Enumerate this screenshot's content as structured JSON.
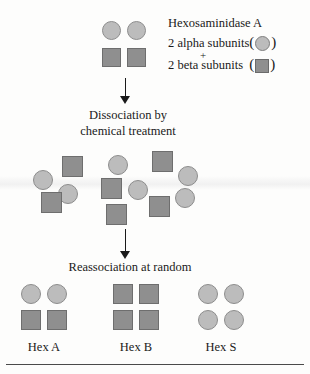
{
  "figure": {
    "title_text": "Hexosaminidase A subunit dissociation and reassociation",
    "legend": {
      "heading": "Hexosaminidase A",
      "alpha_line": "2 alpha subunits",
      "plus": "+",
      "beta_line": "2 beta subunits",
      "open_paren": "(",
      "close_paren": ")",
      "alpha_swatch": "circle-subunit-icon",
      "beta_swatch": "square-subunit-icon"
    },
    "steps": [
      {
        "line1": "Dissociation by",
        "line2": "chemical treatment"
      },
      {
        "line1": "Reassociation at random",
        "line2": ""
      }
    ],
    "arrows": [
      {
        "name": "arrow-dissociation"
      },
      {
        "name": "arrow-reassociation"
      }
    ],
    "top_complex": {
      "name": "hexosaminidase-a-tetramer",
      "composition": "2 alpha (circle) + 2 beta (square)"
    },
    "dissociated_pool": {
      "circle_count": 6,
      "square_count": 6
    },
    "products": [
      {
        "label": "Hex A",
        "name": "hex-a-complex",
        "top_row": [
          "circle",
          "circle"
        ],
        "bottom_row": [
          "square",
          "square"
        ]
      },
      {
        "label": "Hex B",
        "name": "hex-b-complex",
        "top_row": [
          "square",
          "square"
        ],
        "bottom_row": [
          "square",
          "square"
        ]
      },
      {
        "label": "Hex S",
        "name": "hex-s-complex",
        "top_row": [
          "circle",
          "circle"
        ],
        "bottom_row": [
          "circle",
          "circle"
        ]
      }
    ],
    "colors": {
      "circle_fill": "#bcbcbc",
      "circle_stroke": "#8d8d8d",
      "square_fill": "#8f8f8f",
      "square_stroke": "#6e6e6e",
      "text": "#1a1a1a",
      "rule": "#4a4a4a",
      "background": "#fdfdfc"
    }
  }
}
